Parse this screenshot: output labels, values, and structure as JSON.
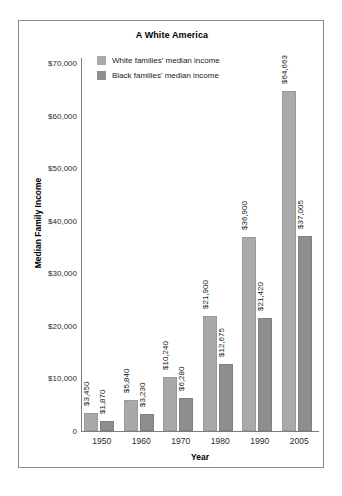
{
  "chart_data": {
    "type": "bar",
    "title": "A White America",
    "xlabel": "Year",
    "ylabel": "Median Family Income",
    "categories": [
      "1950",
      "1960",
      "1970",
      "1980",
      "1990",
      "2005"
    ],
    "series": [
      {
        "name": "White families' median income",
        "color": "#a9a9a9",
        "values": [
          3450,
          5840,
          10240,
          21900,
          36900,
          64663
        ],
        "labels": [
          "$3,450",
          "$5,840",
          "$10,240",
          "$21,900",
          "$36,900",
          "$64,663"
        ]
      },
      {
        "name": "Black families' median income",
        "color": "#8e8e8e",
        "values": [
          1870,
          3230,
          6280,
          12675,
          21420,
          37005
        ],
        "labels": [
          "$1,870",
          "$3,230",
          "$6,280",
          "$12,675",
          "$21,420",
          "$37,005"
        ]
      }
    ],
    "ylim": [
      0,
      70000
    ],
    "yticks": [
      0,
      10000,
      20000,
      30000,
      40000,
      50000,
      60000,
      70000
    ],
    "ytick_labels": [
      "0",
      "$10,000",
      "$20,000",
      "$30,000",
      "$40,000",
      "$50,000",
      "$60,000",
      "$70,000"
    ],
    "grid": false,
    "legend_position": "top-left-inside"
  }
}
